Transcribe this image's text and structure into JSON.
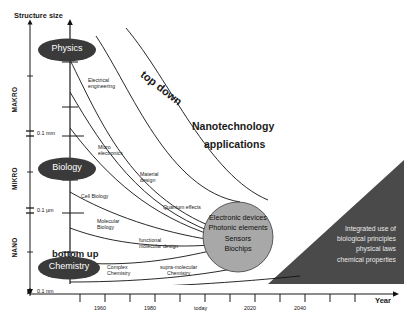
{
  "figure": {
    "title_y_axis": "Structure size",
    "title_x_axis": "Year",
    "headline_line1": "Nanotechnology",
    "headline_line2": "applications"
  },
  "y_axis": {
    "label": "Structure size",
    "scale_bands": [
      {
        "name": "MAKRO"
      },
      {
        "name": "MIKRO"
      },
      {
        "name": "NANO"
      }
    ],
    "tick_labels": [
      "0.1 mm",
      "0.1 µm",
      "0.1 nm"
    ]
  },
  "x_axis": {
    "label": "Year",
    "tick_labels": [
      "1960",
      "1980",
      "today",
      "2020",
      "2040"
    ]
  },
  "disciplines": [
    {
      "name": "Physics"
    },
    {
      "name": "Biology"
    },
    {
      "name": "Chemistry"
    }
  ],
  "directions": {
    "top_down": "top down",
    "bottom_up": "bottom up"
  },
  "curve_labels": [
    {
      "id": "electrical-engineering",
      "line1": "Electrical",
      "line2": "engineering"
    },
    {
      "id": "micro-electronics",
      "line1": "Micro",
      "line2": "electronics"
    },
    {
      "id": "material-design",
      "line1": "Material",
      "line2": "design"
    },
    {
      "id": "quantum-effects",
      "line1": "Quantum effects",
      "line2": ""
    },
    {
      "id": "cell-biology",
      "line1": "Cell Biology",
      "line2": ""
    },
    {
      "id": "molecular-biology",
      "line1": "Molecular",
      "line2": "Biology"
    },
    {
      "id": "functional-molecular-design",
      "line1": "functional",
      "line2": "molecular design"
    },
    {
      "id": "complex-chemistry",
      "line1": "Complex",
      "line2": "Chemistry"
    },
    {
      "id": "supra-molecular-chemistry",
      "line1": "supra-molecular",
      "line2": "Chemistry"
    }
  ],
  "convergence_circle": {
    "items": [
      "Electronic devices",
      "Photonic elements",
      "Sensors",
      "Biochips"
    ]
  },
  "future_region": {
    "lines": [
      "Integrated use of",
      "biological principles",
      "physical laws",
      "chemical properties"
    ]
  },
  "colors": {
    "ellipse_fill": "#3a3a3a",
    "circle_fill": "#a8a8a8",
    "triangle_fill": "#4a4a4a",
    "axis": "#1a1a1a",
    "curve": "#111111",
    "text": "#1a1a1a",
    "inverse_text": "#ffffff"
  }
}
